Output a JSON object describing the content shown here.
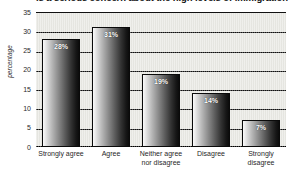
{
  "chart_data": {
    "type": "bar",
    "title": "is a serious concern about the high levels of immigration",
    "xlabel": "",
    "ylabel": "percentage",
    "categories": [
      "Strongly agree",
      "Agree",
      "Neither agree nor disagree",
      "Disagree",
      "Strongly disagree"
    ],
    "category_lines": [
      [
        "Strongly agree"
      ],
      [
        "Agree"
      ],
      [
        "Neither agree",
        "nor disagree"
      ],
      [
        "Disagree"
      ],
      [
        "Strongly",
        "disagree"
      ]
    ],
    "values": [
      28,
      31,
      19,
      14,
      7
    ],
    "data_labels": [
      "28%",
      "31%",
      "19%",
      "14%",
      "7%"
    ],
    "ylim": [
      0,
      35
    ],
    "ytick_values": [
      0,
      5,
      10,
      15,
      20,
      25,
      30,
      35
    ],
    "ytick_labels": [
      "0",
      "5",
      "10",
      "15",
      "20",
      "25",
      "30",
      "35"
    ],
    "grid": true,
    "grid_axis": "y",
    "legend": false,
    "legend_position": "none",
    "colors": {
      "bar_gradient_light": "#fbfbfb",
      "bar_gradient_dark": "#0b0b0b",
      "bar_outline": "#0a0a0a",
      "plot_background": "#e9e9e4",
      "gridline": "#111111",
      "axis": "#000000",
      "data_label_text": "#ffffff",
      "tick_text": "#1f1f1f",
      "figure_background": "#ffffff"
    }
  }
}
